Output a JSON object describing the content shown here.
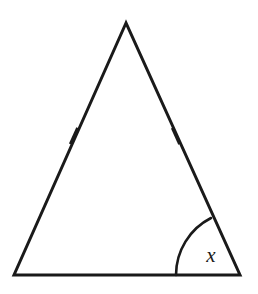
{
  "figure": {
    "kind": "geometry-diagram",
    "background_color": "#ffffff",
    "stroke_color": "#1a1a1a",
    "label_color": "#1a1a1a",
    "canvas": {
      "width": 258,
      "height": 294
    }
  },
  "triangle": {
    "name": "isosceles-triangle",
    "stroke_width": 3,
    "vertices": {
      "apex": {
        "x": 126,
        "y": 23
      },
      "bottom_left": {
        "x": 14,
        "y": 275
      },
      "bottom_right": {
        "x": 240,
        "y": 275
      }
    },
    "path": "M 126 23 L 14 275 L 240 275 Z"
  },
  "tick_marks": [
    {
      "name": "left-side-tick",
      "side": "left-leg",
      "count": 1,
      "center": {
        "x": 74,
        "y": 136
      },
      "length": 18,
      "stroke_width": 3,
      "angle_deg": -66.0
    },
    {
      "name": "right-side-tick",
      "side": "right-leg",
      "count": 1,
      "center": {
        "x": 176,
        "y": 136
      },
      "length": 18,
      "stroke_width": 3,
      "angle_deg": 66.0
    }
  ],
  "angle_arc": {
    "name": "base-right-angle-arc",
    "at_vertex": "bottom_right",
    "radius": 64,
    "stroke_width": 2.6,
    "path": "M 176 275 A 64 64 0 0 1 211 218"
  },
  "labels": {
    "angle_x": {
      "text": "x",
      "x": 211,
      "y": 262,
      "font_size": 21,
      "style": "italic"
    }
  }
}
